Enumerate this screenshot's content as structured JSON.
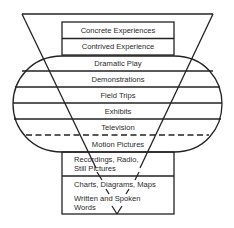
{
  "diagram": {
    "levels": [
      {
        "label": "Concrete Experiences"
      },
      {
        "label": "Contrived Experience"
      },
      {
        "label": "Dramatic Play"
      },
      {
        "label": "Demonstrations"
      },
      {
        "label": "Field Trips"
      },
      {
        "label": "Exhibits"
      },
      {
        "label": "Television"
      },
      {
        "label": "Motion Pictures"
      },
      {
        "label_line1": "Recordings, Radio,",
        "label_line2": "Still Pictures"
      },
      {
        "label": "Charts, Diagrams, Maps"
      },
      {
        "label_line1": "Written and Spoken",
        "label_line2": "Words"
      }
    ],
    "colors": {
      "line": "#222222",
      "text": "#2a2a2a",
      "background": "#ffffff"
    }
  }
}
